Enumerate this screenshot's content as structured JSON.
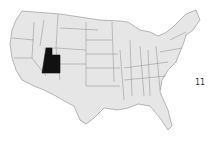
{
  "map": {
    "title": "United States",
    "highlighted_state": "Utah",
    "colors": {
      "land": "#e6e6e6",
      "border": "#8a8a8a",
      "highlight": "#111111",
      "background": "#ffffff"
    }
  },
  "side_label": "11"
}
